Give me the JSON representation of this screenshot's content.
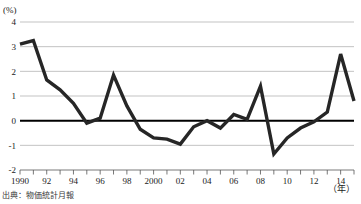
{
  "figure": {
    "y_unit_label": "(%)",
    "x_unit_label": "（年）",
    "source_note": "出典：物価統計月報"
  },
  "chart_data": {
    "type": "line",
    "title": "",
    "xlabel": "（年）",
    "ylabel": "(%)",
    "xlim": [
      1990,
      2015
    ],
    "ylim": [
      -2,
      4
    ],
    "yticks": [
      -2,
      -1,
      0,
      1,
      2,
      3,
      4
    ],
    "ytick_labels": [
      "-2",
      "-1",
      "0",
      "1",
      "2",
      "3",
      "4"
    ],
    "xticks": [
      1990,
      1991,
      1992,
      1993,
      1994,
      1995,
      1996,
      1997,
      1998,
      1999,
      2000,
      2001,
      2002,
      2003,
      2004,
      2005,
      2006,
      2007,
      2008,
      2009,
      2010,
      2011,
      2012,
      2013,
      2014,
      2015
    ],
    "xtick_labels_shown": [
      "1990",
      "92",
      "94",
      "96",
      "98",
      "2000",
      "02",
      "04",
      "06",
      "08",
      "10",
      "12",
      "14"
    ],
    "grid": true,
    "grid_axis": "y",
    "zero_line_emphasized": true,
    "legend": false,
    "legend_position": "none",
    "series": [
      {
        "name": "",
        "color": "#262626",
        "x": [
          1990,
          1991,
          1992,
          1993,
          1994,
          1995,
          1996,
          1997,
          1998,
          1999,
          2000,
          2001,
          2002,
          2003,
          2004,
          2005,
          2006,
          2007,
          2008,
          2009,
          2010,
          2011,
          2012,
          2013,
          2014,
          2015
        ],
        "values": [
          3.1,
          3.25,
          1.65,
          1.25,
          0.7,
          -0.1,
          0.1,
          1.85,
          0.6,
          -0.35,
          -0.7,
          -0.75,
          -0.95,
          -0.25,
          0.0,
          -0.3,
          0.25,
          0.05,
          1.4,
          -1.35,
          -0.7,
          -0.3,
          -0.05,
          0.35,
          2.7,
          0.8
        ]
      }
    ]
  }
}
